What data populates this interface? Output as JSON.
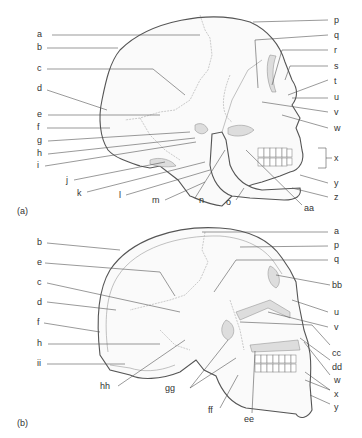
{
  "figure": {
    "panels": [
      {
        "id": "a",
        "caption": "(a)",
        "view": "lateral view of skull",
        "labels_left": [
          "a",
          "b",
          "c",
          "d",
          "e",
          "f",
          "g",
          "h",
          "i",
          "j",
          "k",
          "l",
          "m"
        ],
        "labels_bottom": [
          "n",
          "o",
          "aa"
        ],
        "labels_right": [
          "p",
          "q",
          "r",
          "s",
          "t",
          "u",
          "v",
          "w",
          "x",
          "y",
          "z"
        ]
      },
      {
        "id": "b",
        "caption": "(b)",
        "view": "sagittal section of skull",
        "labels_left": [
          "b",
          "e",
          "c",
          "d",
          "f",
          "h",
          "ii"
        ],
        "labels_bottom": [
          "hh",
          "gg",
          "ff",
          "ee"
        ],
        "labels_right": [
          "a",
          "p",
          "q",
          "bb",
          "u",
          "v",
          "cc",
          "dd",
          "w",
          "x",
          "y"
        ]
      }
    ]
  },
  "labels": {
    "A": {
      "a": "a",
      "b": "b",
      "c": "c",
      "d": "d",
      "e": "e",
      "f": "f",
      "g": "g",
      "h": "h",
      "i": "i",
      "j": "j",
      "k": "k",
      "l": "l",
      "m": "m",
      "n": "n",
      "o": "o",
      "p": "p",
      "q": "q",
      "r": "r",
      "s": "s",
      "t": "t",
      "u": "u",
      "v": "v",
      "w": "w",
      "x": "x",
      "y": "y",
      "z": "z",
      "aa": "aa"
    },
    "B": {
      "b": "b",
      "e": "e",
      "c": "c",
      "d": "d",
      "f": "f",
      "h": "h",
      "ii": "ii",
      "hh": "hh",
      "gg": "gg",
      "ff": "ff",
      "ee": "ee",
      "a": "a",
      "p": "p",
      "q": "q",
      "bb": "bb",
      "u": "u",
      "v": "v",
      "cc": "cc",
      "dd": "dd",
      "w": "w",
      "x": "x",
      "y": "y"
    }
  },
  "captions": {
    "a": "(a)",
    "b": "(b)"
  }
}
